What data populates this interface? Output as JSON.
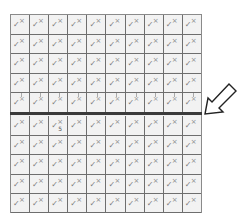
{
  "grid": {
    "columns": 10,
    "rows_above_line": 5,
    "rows_below_line": 5,
    "cell_check_glyph": "✓",
    "cell_mark_glyph": "×",
    "highlight_row_index": 4,
    "special_cell": {
      "row": 5,
      "col": 2,
      "label": "5"
    },
    "colors": {
      "cell_bg": "#f2f2f2",
      "grid_line": "#6e6e6e",
      "divider": "#3a3a3a"
    }
  },
  "divider": {
    "name": "thick-horizontal-line"
  },
  "pointer": {
    "icon": "arrow-pointing-down-left-icon"
  }
}
